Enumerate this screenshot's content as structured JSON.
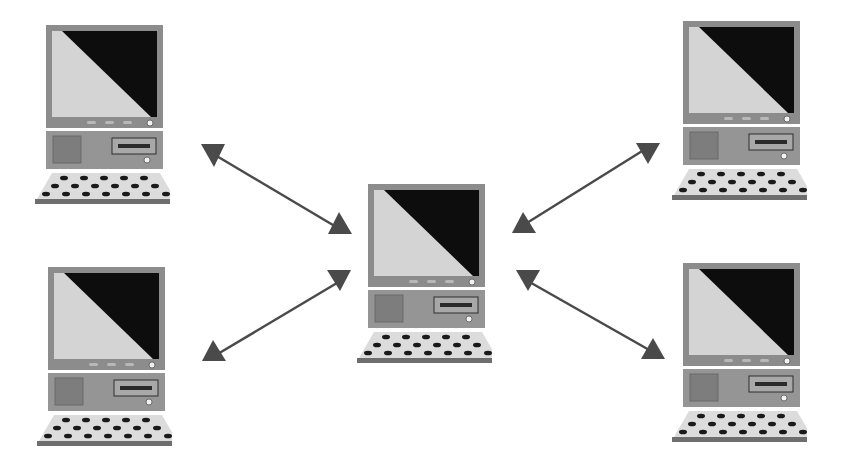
{
  "diagram": {
    "type": "network-star",
    "colors": {
      "background": "#ffffff",
      "bezel": "#8c8c8c",
      "screen_light": "#d4d4d4",
      "screen_dark": "#0d0d0d",
      "base": "#959595",
      "keyboard_top": "#dcdcdc",
      "keyboard_edge": "#6e6e6e",
      "key": "#1a1a1a",
      "arrow": "#4a4a4a"
    },
    "nodes": [
      {
        "id": "top-left",
        "x": 30,
        "y": 22
      },
      {
        "id": "bottom-left",
        "x": 32,
        "y": 264
      },
      {
        "id": "center",
        "x": 352,
        "y": 181
      },
      {
        "id": "top-right",
        "x": 667,
        "y": 18
      },
      {
        "id": "bottom-right",
        "x": 667,
        "y": 260
      }
    ],
    "edges": [
      {
        "from": "center",
        "to": "top-left",
        "bidirectional": true
      },
      {
        "from": "center",
        "to": "bottom-left",
        "bidirectional": true
      },
      {
        "from": "center",
        "to": "top-right",
        "bidirectional": true
      },
      {
        "from": "center",
        "to": "bottom-right",
        "bidirectional": true
      }
    ]
  }
}
